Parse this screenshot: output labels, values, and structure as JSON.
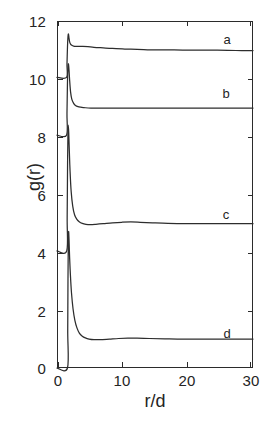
{
  "figure": {
    "background": "#ffffff",
    "ink_color": "#2b2b2b"
  },
  "axes": {
    "xlabel": "r/d",
    "ylabel": "g(r)",
    "x_ticks": [
      "0",
      "10",
      "20",
      "30"
    ],
    "x_tick_values": [
      0,
      10,
      20,
      30
    ],
    "y_ticks": [
      "0",
      "2",
      "4",
      "6",
      "8",
      "10",
      "12"
    ],
    "y_tick_values": [
      0,
      2,
      4,
      6,
      8,
      10,
      12
    ],
    "xlim": [
      0,
      31.8
    ],
    "ylim": [
      0,
      12
    ],
    "grid": false,
    "frame": true,
    "tick_direction": "in"
  },
  "curve_labels": {
    "a": "a",
    "b": "b",
    "c": "c",
    "d": "d"
  },
  "chart_data": {
    "type": "line",
    "title": "",
    "subtitle": "",
    "xlabel": "r/d",
    "ylabel": "g(r)",
    "xlim": [
      0,
      31.8
    ],
    "ylim": [
      0,
      12
    ],
    "grid": false,
    "legend": "inline-curve-labels",
    "legend_position": "right-inside",
    "annotations": [
      {
        "text": "a",
        "x": 26.0,
        "y": 11.5
      },
      {
        "text": "b",
        "x": 25.8,
        "y": 9.6
      },
      {
        "text": "c",
        "x": 25.8,
        "y": 5.5
      },
      {
        "text": "d",
        "x": 26.0,
        "y": 1.45
      }
    ],
    "series": [
      {
        "name": "a",
        "baseline": 11.0,
        "peak_x": 1.9,
        "peak_y": 11.55,
        "x": [
          0.0,
          1.55,
          1.62,
          1.7,
          1.78,
          1.86,
          1.94,
          2.05,
          2.2,
          2.4,
          2.7,
          3.1,
          3.6,
          4.2,
          5.0,
          6.0,
          7.5,
          9.0,
          11.0,
          13.0,
          16.0,
          19.0,
          22.0,
          26.0,
          29.0,
          31.8
        ],
        "y": [
          10.05,
          10.05,
          10.5,
          11.1,
          11.45,
          11.55,
          11.42,
          11.28,
          11.2,
          11.16,
          11.13,
          11.12,
          11.12,
          11.12,
          11.11,
          11.09,
          11.07,
          11.05,
          11.03,
          11.02,
          11.0,
          11.0,
          10.99,
          10.99,
          10.98,
          10.98
        ]
      },
      {
        "name": "b",
        "baseline": 9.0,
        "peak_x": 1.85,
        "peak_y": 10.52,
        "x": [
          0.0,
          1.55,
          1.62,
          1.7,
          1.78,
          1.85,
          1.95,
          2.05,
          2.2,
          2.4,
          2.7,
          3.0,
          3.4,
          3.9,
          4.6,
          5.5,
          7.0,
          9.0,
          12.0,
          15.0,
          19.0,
          23.0,
          27.0,
          31.8
        ],
        "y": [
          8.05,
          8.05,
          8.8,
          9.9,
          10.4,
          10.52,
          10.3,
          9.95,
          9.55,
          9.3,
          9.15,
          9.08,
          9.04,
          9.02,
          9.0,
          8.99,
          8.99,
          8.99,
          8.99,
          8.99,
          8.99,
          8.99,
          8.99,
          8.99
        ]
      },
      {
        "name": "c",
        "baseline": 5.0,
        "peak_x": 1.82,
        "peak_y": 8.4,
        "x": [
          0.0,
          1.58,
          1.65,
          1.72,
          1.78,
          1.82,
          1.9,
          2.0,
          2.12,
          2.3,
          2.55,
          2.85,
          3.2,
          3.6,
          4.1,
          4.7,
          5.4,
          6.3,
          7.5,
          9.0,
          10.5,
          12.0,
          13.5,
          15.5,
          18.0,
          21.0,
          25.0,
          28.5,
          31.8
        ],
        "y": [
          4.05,
          4.05,
          5.2,
          7.2,
          8.15,
          8.4,
          8.15,
          7.5,
          6.8,
          6.1,
          5.6,
          5.3,
          5.15,
          5.06,
          5.0,
          4.97,
          4.96,
          4.97,
          4.99,
          5.02,
          5.04,
          5.05,
          5.04,
          5.02,
          5.0,
          4.99,
          4.99,
          4.99,
          4.99
        ]
      },
      {
        "name": "d",
        "baseline": 1.0,
        "peak_x": 1.88,
        "peak_y": 4.72,
        "x": [
          0.0,
          1.7,
          1.74,
          1.78,
          1.83,
          1.88,
          1.95,
          2.05,
          2.18,
          2.35,
          2.6,
          2.9,
          3.25,
          3.65,
          4.1,
          4.6,
          5.2,
          6.0,
          7.0,
          8.5,
          10.0,
          11.5,
          13.0,
          15.0,
          17.5,
          20.5,
          24.0,
          28.0,
          31.8
        ],
        "y": [
          0.0,
          0.0,
          1.3,
          3.0,
          4.3,
          4.72,
          4.45,
          3.8,
          3.2,
          2.6,
          2.05,
          1.65,
          1.38,
          1.2,
          1.1,
          1.04,
          1.0,
          0.98,
          0.98,
          1.0,
          1.02,
          1.03,
          1.03,
          1.02,
          1.01,
          1.0,
          1.0,
          1.0,
          1.0
        ]
      }
    ]
  }
}
